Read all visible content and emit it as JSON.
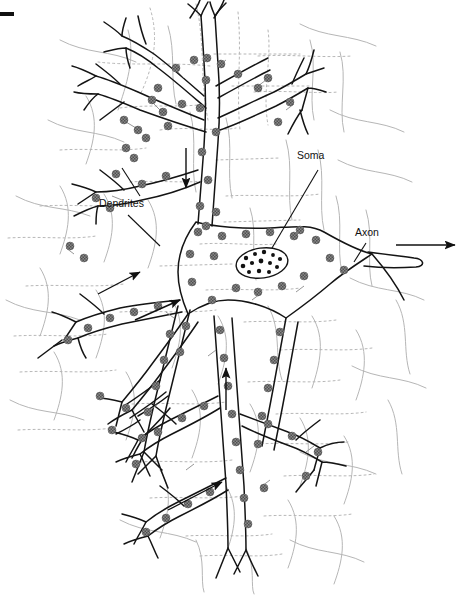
{
  "figure": {
    "kind": "line-drawing",
    "background_color": "#ffffff",
    "ink_color": "#111111",
    "bouton_color": "#7c7c7c",
    "faint_trace_color": "#b6b6b6"
  },
  "labels": {
    "dendrites": "Dendrites",
    "soma": "Soma",
    "axon": "Axon"
  },
  "markers": {
    "corner_dash": "corner-dash-mark",
    "axon_direction_arrow": "axon-output-arrow",
    "dendrite_flow_arrows": [
      "down-arrow-upper-dendrite",
      "right-arrow-left-dendrite",
      "right-arrow-upper-left-dendrite",
      "up-arrow-lower-dendrite",
      "up-right-arrow-bottom-dendrite"
    ]
  },
  "parts": {
    "soma_nucleus": "nucleus-ellipse",
    "nucleus_granule_count": 13,
    "synaptic_boutons": "synaptic-bouton",
    "presynaptic_traces": "presynaptic-axon-trace"
  },
  "geometry": {
    "nucleus": {
      "cx": 262,
      "cy": 263,
      "rx": 26,
      "ry": 15,
      "rotate": -8
    },
    "axon_arrow": {
      "x1": 396,
      "y1": 245,
      "x2": 458,
      "y2": 245
    },
    "label_positions": {
      "dendrites": {
        "x": 99,
        "y": 207
      },
      "soma": {
        "x": 297,
        "y": 159
      },
      "axon": {
        "x": 355,
        "y": 236
      }
    }
  }
}
